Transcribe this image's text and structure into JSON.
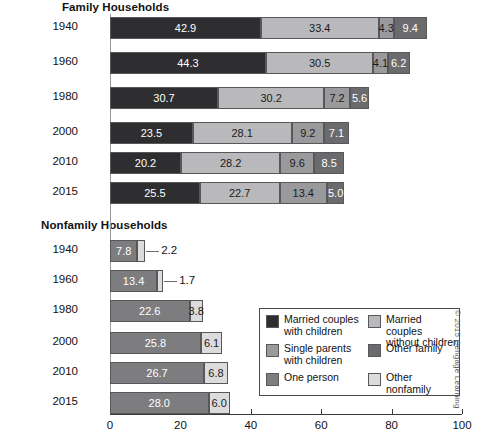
{
  "axis": {
    "ticks": [
      0,
      20,
      40,
      60,
      80,
      100
    ],
    "min": 0,
    "max": 100
  },
  "sections": {
    "family": {
      "title": "Family Households"
    },
    "nonfamily": {
      "title": "Nonfamily Households"
    }
  },
  "legend": {
    "items": [
      {
        "label": "Married couples\nwith children",
        "color": "#2e2e30"
      },
      {
        "label": "Married couples\nwithout children",
        "color": "#b9b9bb"
      },
      {
        "label": "Single parents\nwith children",
        "color": "#9a9a9c"
      },
      {
        "label": "Other family",
        "color": "#6b6b6d"
      },
      {
        "label": "One person",
        "color": "#7d7d7f"
      },
      {
        "label": "Other nonfamily",
        "color": "#dcdcdc"
      }
    ]
  },
  "copyright": "© 2015 Cengage Learning",
  "chart_data": {
    "type": "bar",
    "orientation": "horizontal",
    "stacked": true,
    "title": "",
    "xlabel": "",
    "ylabel": "",
    "xlim": [
      0,
      100
    ],
    "xticks": [
      0,
      20,
      40,
      60,
      80,
      100
    ],
    "grid": false,
    "legend_position": "inside-bottom-right",
    "panels": [
      {
        "name": "Family Households",
        "categories": [
          "1940",
          "1960",
          "1980",
          "2000",
          "2010",
          "2015"
        ],
        "series": [
          {
            "name": "Married couples with children",
            "color": "#2e2e30",
            "values": [
              42.9,
              44.3,
              30.7,
              23.5,
              20.2,
              25.5
            ]
          },
          {
            "name": "Married couples without children",
            "color": "#b9b9bb",
            "values": [
              33.4,
              30.5,
              30.2,
              28.1,
              28.2,
              22.7
            ]
          },
          {
            "name": "Single parents with children",
            "color": "#9a9a9c",
            "values": [
              4.3,
              4.1,
              7.2,
              9.2,
              9.6,
              13.4
            ]
          },
          {
            "name": "Other family",
            "color": "#6b6b6d",
            "values": [
              9.4,
              6.2,
              5.6,
              7.1,
              8.5,
              5.0
            ]
          }
        ]
      },
      {
        "name": "Nonfamily Households",
        "categories": [
          "1940",
          "1960",
          "1980",
          "2000",
          "2010",
          "2015"
        ],
        "series": [
          {
            "name": "One person",
            "color": "#7d7d7f",
            "values": [
              7.8,
              13.4,
              22.6,
              25.8,
              26.7,
              28.0
            ]
          },
          {
            "name": "Other nonfamily",
            "color": "#dcdcdc",
            "values": [
              2.2,
              1.7,
              3.8,
              6.1,
              6.8,
              6.0
            ]
          }
        ]
      }
    ]
  },
  "layout": {
    "x0": 110,
    "pxPerUnit": 3.52,
    "familyRowTops": [
      17,
      52,
      87,
      122,
      152,
      182
    ],
    "nonfamilyRowTops": [
      240,
      270,
      300,
      332,
      362,
      392
    ],
    "calloutThreshold": 3.0
  }
}
